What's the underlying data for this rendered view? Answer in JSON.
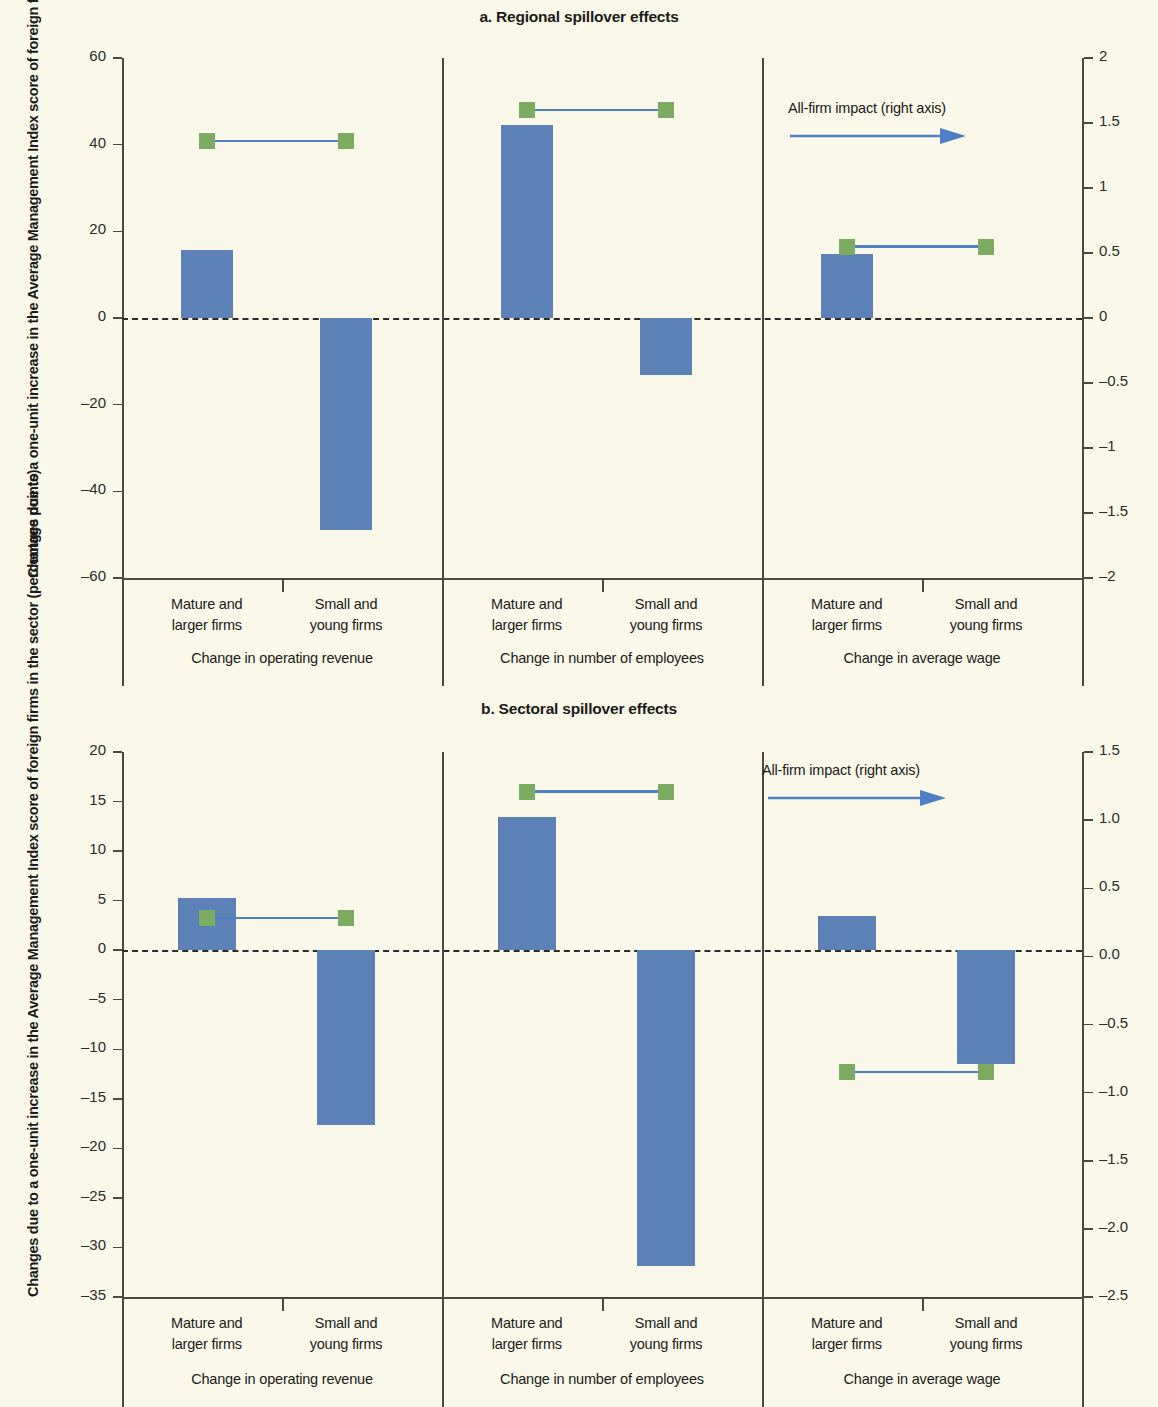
{
  "figure": {
    "background_color": "#faf9e9",
    "bar_color": "#5b81b7",
    "marker_color": "#7cab62",
    "connector_color": "#4d7fc4"
  },
  "panel_a": {
    "title": "a. Regional spillover effects",
    "ylabel": "Changes due to a one-unit increase in the Average Management Index score of foreign firms in the region (percentage points)",
    "annotation": "All-firm impact (right axis)",
    "left_ticks": [
      "60",
      "40",
      "20",
      "0",
      "–20",
      "–40",
      "–60"
    ],
    "right_ticks": [
      "2",
      "1.5",
      "1",
      "0.5",
      "0",
      "–0.5",
      "–1",
      "–1.5",
      "–2"
    ],
    "categories": [
      "Mature and\nlarger firms",
      "Small and\nyoung firms"
    ],
    "group_labels": [
      "Change in operating revenue",
      "Change in number of employees",
      "Change in average wage"
    ],
    "cat_line1": "Mature and",
    "cat_line2": "larger firms",
    "cat2_line1": "Small and",
    "cat2_line2": "young firms"
  },
  "panel_b": {
    "title": "b. Sectoral spillover effects",
    "ylabel": "Changes due to a one-unit increase in the Average Management Index score of foreign firms in the sector (percentage points)",
    "annotation": "All-firm impact (right axis)",
    "left_ticks": [
      "20",
      "15",
      "10",
      "5",
      "0",
      "–5",
      "–10",
      "–15",
      "–20",
      "–25",
      "–30",
      "–35"
    ],
    "right_ticks": [
      "1.5",
      "1.0",
      "0.5",
      "0.0",
      "–0.5",
      "–1.0",
      "–1.5",
      "–2.0",
      "–2.5"
    ],
    "group_labels": [
      "Change in operating revenue",
      "Change in number of employees",
      "Change in average wage"
    ],
    "cat_line1": "Mature and",
    "cat_line2": "larger firms",
    "cat2_line1": "Small and",
    "cat2_line2": "young firms"
  },
  "chart_data": [
    {
      "type": "bar",
      "title": "a. Regional spillover effects",
      "xlabel": "",
      "ylabel": "Changes due to a one-unit increase in the Average Management Index score of foreign firms in the region (percentage points)",
      "ylabel_right": "All-firm impact (right axis)",
      "ylim": [
        -60,
        60
      ],
      "ylim_right": [
        -2,
        2
      ],
      "yticks": [
        60,
        40,
        20,
        0,
        -20,
        -40,
        -60
      ],
      "yticks_right": [
        2,
        1.5,
        1,
        0.5,
        0,
        -0.5,
        -1,
        -1.5,
        -2
      ],
      "grid": false,
      "legend": "All-firm impact (right axis)",
      "groups": [
        {
          "name": "Change in operating revenue",
          "categories": [
            "Mature and larger firms",
            "Small and young firms"
          ],
          "bar_values": [
            15.8,
            -49.0
          ],
          "all_firm_impact_right_axis": [
            1.36,
            1.36
          ]
        },
        {
          "name": "Change in number of employees",
          "categories": [
            "Mature and larger firms",
            "Small and young firms"
          ],
          "bar_values": [
            44.5,
            -13.2
          ],
          "all_firm_impact_right_axis": [
            1.6,
            1.6
          ]
        },
        {
          "name": "Change in average wage",
          "categories": [
            "Mature and larger firms",
            "Small and young firms"
          ],
          "bar_values": [
            14.8,
            0.0
          ],
          "all_firm_impact_right_axis": [
            0.55,
            0.55
          ]
        }
      ]
    },
    {
      "type": "bar",
      "title": "b. Sectoral spillover effects",
      "xlabel": "",
      "ylabel": "Changes due to a one-unit increase in the Average Management Index score of foreign firms in the sector (percentage points)",
      "ylabel_right": "All-firm impact (right axis)",
      "ylim": [
        -35,
        20
      ],
      "ylim_right": [
        -2.5,
        1.5
      ],
      "yticks": [
        20,
        15,
        10,
        5,
        0,
        -5,
        -10,
        -15,
        -20,
        -25,
        -30,
        -35
      ],
      "yticks_right": [
        1.5,
        1.0,
        0.5,
        0.0,
        -0.5,
        -1.0,
        -1.5,
        -2.0,
        -2.5
      ],
      "grid": false,
      "legend": "All-firm impact (right axis)",
      "groups": [
        {
          "name": "Change in operating revenue",
          "categories": [
            "Mature and larger firms",
            "Small and young firms"
          ],
          "bar_values": [
            5.3,
            -17.6
          ],
          "all_firm_impact_right_axis": [
            0.28,
            0.28
          ]
        },
        {
          "name": "Change in number of employees",
          "categories": [
            "Mature and larger firms",
            "Small and young firms"
          ],
          "bar_values": [
            13.4,
            -31.9
          ],
          "all_firm_impact_right_axis": [
            1.21,
            1.21
          ]
        },
        {
          "name": "Change in average wage",
          "categories": [
            "Mature and larger firms",
            "Small and young firms"
          ],
          "bar_values": [
            3.5,
            -11.5
          ],
          "all_firm_impact_right_axis": [
            -0.85,
            -0.85
          ]
        }
      ]
    }
  ]
}
